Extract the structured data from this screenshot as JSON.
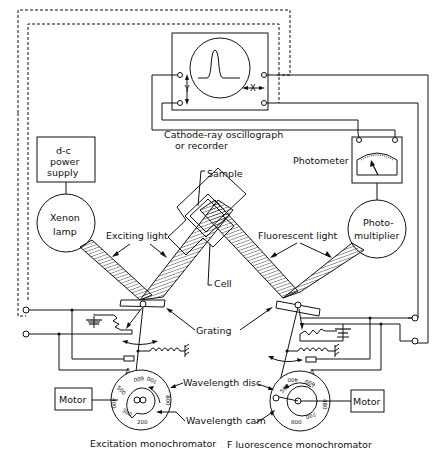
{
  "diagram": {
    "type": "schematic",
    "colors": {
      "ink": "#111111",
      "background": "#ffffff"
    },
    "labels": {
      "oscillograph_line1": "Cathode-ray oscillograph",
      "oscillograph_line2": "or recorder",
      "oscillograph_x": "X",
      "oscillograph_y": "Y",
      "power_supply_line1": "d-c",
      "power_supply_line2": "power",
      "power_supply_line3": "supply",
      "photometer": "Photometer",
      "xenon_line1": "Xenon",
      "xenon_line2": "lamp",
      "photomultiplier_line1": "Photo-",
      "photomultiplier_line2": "multiplier",
      "sample": "Sample",
      "cell": "Cell",
      "exciting_light": "Exciting light",
      "fluorescent_light": "Fluorescent light",
      "grating": "Grating",
      "wavelength_disc": "Wavelength disc",
      "wavelength_cam": "Wavelength cam",
      "motor_left": "Motor",
      "motor_right": "Motor",
      "excitation_monochromator": "Excitation monochromator",
      "fluorescence_monochromator": "F luorescence monochromator"
    },
    "dials": {
      "excitation": [
        "200",
        "300",
        "400",
        "500",
        "600",
        "700",
        "800"
      ],
      "fluorescence": [
        "200",
        "400",
        "500",
        "600",
        "800",
        "700"
      ]
    }
  }
}
